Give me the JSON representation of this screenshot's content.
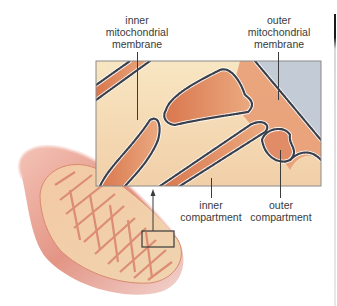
{
  "diagram": {
    "labels": {
      "inner_membrane": [
        "inner",
        "mitochondrial",
        "membrane"
      ],
      "outer_membrane": [
        "outer",
        "mitochondrial",
        "membrane"
      ],
      "inner_compartment": [
        "inner",
        "compartment"
      ],
      "outer_compartment": [
        "outer",
        "compartment"
      ]
    },
    "colors": {
      "matrix_cream": "#f6dfb8",
      "membrane_orange": "#e0936a",
      "membrane_dark": "#3b3f4a",
      "outside_blue": "#c3ccd6",
      "mito_outer_pink": "#e8a49a",
      "panel_border": "#8a8a8a"
    }
  }
}
